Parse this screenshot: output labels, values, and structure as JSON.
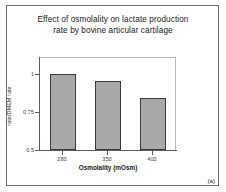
{
  "figure": {
    "panel_label": "(a)",
    "background_color": "#ffffff",
    "border_color": "#6e6e6e"
  },
  "chart_data": {
    "type": "bar",
    "title": "Effect of osmolality on lactate production rate by bovine articular cartilage",
    "title_lines": [
      "Effect of osmolality on lactate production",
      "rate by bovine articular cartilage"
    ],
    "categories": [
      "280",
      "350",
      "400"
    ],
    "values": [
      1.0,
      0.955,
      0.84
    ],
    "xlabel": "Osmolality (mOsm)",
    "ylabel": "rate/DMEM rate",
    "ylim": [
      0.5,
      1.05
    ],
    "yticks": [
      1,
      0.75,
      0.5
    ],
    "ytick_labels": [
      "1",
      "0.75",
      "0.5"
    ],
    "grid": false,
    "legend": false,
    "bar_color": "#a8a8a8",
    "bar_edge_color": "#3c3c3c"
  }
}
